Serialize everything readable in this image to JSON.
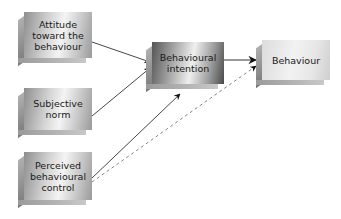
{
  "diagram": {
    "nodes": [
      {
        "id": "attitude",
        "label": "Attitude toward the behaviour"
      },
      {
        "id": "subjective_norm",
        "label": "Subjective norm"
      },
      {
        "id": "pbc",
        "label": "Perceived behavioural control"
      },
      {
        "id": "intention",
        "label": "Behavioural intention"
      },
      {
        "id": "behaviour",
        "label": "Behaviour"
      }
    ],
    "edges": [
      {
        "from": "attitude",
        "to": "intention",
        "style": "solid"
      },
      {
        "from": "subjective_norm",
        "to": "intention",
        "style": "solid"
      },
      {
        "from": "pbc",
        "to": "intention",
        "style": "solid"
      },
      {
        "from": "intention",
        "to": "behaviour",
        "style": "solid"
      },
      {
        "from": "pbc",
        "to": "behaviour",
        "style": "dashed"
      }
    ],
    "colors": {
      "arrow": "#222222",
      "dashed_arrow": "#666666",
      "box_light": "#f0f0f0",
      "box_dark": "#6a6a6a"
    }
  }
}
